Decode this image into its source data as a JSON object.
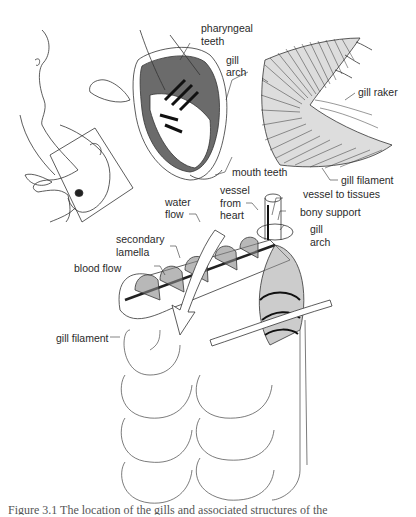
{
  "figure": {
    "panels": {
      "fish_head": {
        "description": "Catfish outline with rectangle indicating region of gills"
      },
      "mouth_view": {
        "labels": {
          "pharyngeal_teeth": "pharyngeal\nteeth",
          "gill_arch": "gill\narch",
          "mouth_teeth": "mouth teeth"
        }
      },
      "gill_arch_detail": {
        "labels": {
          "gill_raker": "gill raker",
          "gill_filament": "gill filament"
        }
      },
      "filament_detail": {
        "labels": {
          "water_flow_1": "water",
          "water_flow_2": "flow",
          "secondary_lamella_1": "secondary",
          "secondary_lamella_2": "lamella",
          "blood_flow": "blood flow",
          "vessel_from_heart_1": "vessel",
          "vessel_from_heart_2": "from",
          "vessel_from_heart_3": "heart",
          "vessel_to_tissues": "vessel to tissues",
          "bony_support": "bony support",
          "gill_arch_1": "gill",
          "gill_arch_2": "arch",
          "gill_filament": "gill filament"
        }
      }
    },
    "caption": "Figure 3.1   The location of the gills and associated structures of the"
  }
}
